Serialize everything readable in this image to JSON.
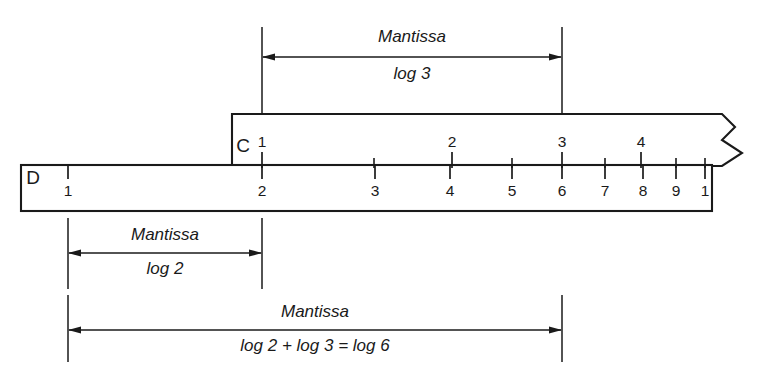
{
  "figure": {
    "line_color": "#1a1a1a",
    "background": "#ffffff"
  },
  "rules": {
    "c_rule": {
      "label": "C",
      "label_x": 243,
      "label_y": 152,
      "left": 232,
      "right": 742,
      "top": 114,
      "bottom": 165,
      "break_edge": "zigzag"
    },
    "d_rule": {
      "label": "D",
      "label_x": 33,
      "label_y": 184,
      "left": 21,
      "right": 712,
      "top": 165,
      "bottom": 211
    }
  },
  "c_scale": {
    "name": "C",
    "label_position": "above",
    "major_ticks": [
      {
        "label": "1",
        "x": 262
      },
      {
        "label": "2",
        "x": 452
      },
      {
        "label": "3",
        "x": 562
      },
      {
        "label": "4",
        "x": 641
      }
    ],
    "minor_ticks": [
      374,
      512,
      605,
      676,
      705
    ]
  },
  "d_scale": {
    "name": "D",
    "label_position": "below",
    "major_ticks": [
      {
        "label": "1",
        "x": 68
      },
      {
        "label": "2",
        "x": 262
      },
      {
        "label": "3",
        "x": 375
      },
      {
        "label": "4",
        "x": 450
      },
      {
        "label": "5",
        "x": 512
      },
      {
        "label": "6",
        "x": 562
      },
      {
        "label": "7",
        "x": 605
      },
      {
        "label": "8",
        "x": 643
      },
      {
        "label": "9",
        "x": 676
      },
      {
        "label": "1",
        "x": 705
      }
    ]
  },
  "annotations": [
    {
      "id": "mantissa-log3",
      "title": "Mantissa",
      "expression": "log 3",
      "from_x": 262,
      "to_x": 562,
      "arrow_y": 57,
      "title_y": 42,
      "expr_y": 79,
      "ext_top": 27,
      "ext_bottom": 114,
      "position": "above"
    },
    {
      "id": "mantissa-log2",
      "title": "Mantissa",
      "expression": "log 2",
      "from_x": 68,
      "to_x": 262,
      "arrow_y": 253,
      "title_y": 240,
      "expr_y": 274,
      "ext_top": 218,
      "ext_bottom": 289,
      "position": "below"
    },
    {
      "id": "mantissa-log2-plus-log3",
      "title": "Mantissa",
      "expression": "log 2 + log 3 = log 6",
      "from_x": 68,
      "to_x": 562,
      "arrow_y": 330,
      "title_y": 317,
      "expr_y": 351,
      "ext_top": 295,
      "ext_bottom": 362,
      "position": "below"
    }
  ]
}
